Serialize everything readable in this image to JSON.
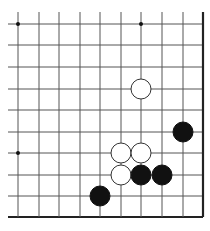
{
  "board": {
    "cols": 10,
    "rows": 10,
    "x_lines": [
      18,
      39,
      59,
      80,
      100,
      121,
      141,
      162,
      183,
      203
    ],
    "y_lines": [
      24,
      45,
      67,
      89,
      110,
      132,
      153,
      175,
      196,
      217
    ],
    "right_edge": true,
    "bottom_edge": true,
    "line_color": "#555555",
    "edge_color": "#222222",
    "stone_radius": 10,
    "star_points": [
      {
        "col": 0,
        "row": 0
      },
      {
        "col": 6,
        "row": 0
      },
      {
        "col": 0,
        "row": 6
      }
    ],
    "stones": [
      {
        "color": "white",
        "col": 6,
        "row": 3
      },
      {
        "color": "black",
        "col": 8,
        "row": 5
      },
      {
        "color": "white",
        "col": 5,
        "row": 6
      },
      {
        "color": "white",
        "col": 6,
        "row": 6
      },
      {
        "color": "white",
        "col": 5,
        "row": 7
      },
      {
        "color": "black",
        "col": 6,
        "row": 7
      },
      {
        "color": "black",
        "col": 7,
        "row": 7
      },
      {
        "color": "black",
        "col": 4,
        "row": 8
      }
    ]
  }
}
